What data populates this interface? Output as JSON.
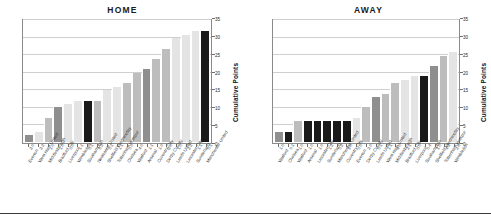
{
  "figure": {
    "y_axis_label": "Cumulative Points",
    "y_ticks": [
      "0",
      "5",
      "10",
      "15",
      "20",
      "25",
      "30",
      "35"
    ],
    "colors": {
      "bar_dark": "#8f8f8f",
      "bar_light": "#e4e4e4",
      "bar_mid": "#bdbdbd",
      "bar_black": "#1a1a1a",
      "grid": "#cfcfcf",
      "axis": "#8a8a8a"
    }
  },
  "chart_data": [
    {
      "type": "bar",
      "title": "HOME",
      "xlabel": "",
      "ylabel": "Cumulative Points",
      "ylim": [
        0,
        35
      ],
      "ytick_step": 5,
      "grid": true,
      "legend": "none",
      "categories": [
        "Everton",
        "West Ham United",
        "Middlesbrough",
        "Bradford City",
        "Liverpool",
        "Wimbledon",
        "Southampton",
        "Newcastle United",
        "Sheffield Wednesday",
        "Tottenham Hotspur",
        "Chelsea",
        "Watford",
        "Arsenal",
        "Coventry City",
        "Derby County",
        "Leeds United",
        "Leicester City",
        "Sunderland",
        "Manchester United"
      ],
      "scores": [
        "2-0",
        "2-2",
        "1-0",
        "1-0",
        "0-0",
        "1-1",
        "0-1",
        "0-3",
        "0-1",
        "1-1",
        "0-0",
        "4-0",
        "1-1",
        "1-0",
        "2-0",
        "1-0",
        "2-2",
        "1-1",
        "0-1"
      ],
      "values": [
        2,
        3,
        7,
        10,
        11,
        12,
        12,
        12,
        15,
        16,
        17,
        20,
        21,
        24,
        27,
        30,
        31,
        32,
        32
      ],
      "bar_colors": [
        "bar_dark",
        "bar_light",
        "bar_mid",
        "bar_dark",
        "bar_light",
        "bar_light",
        "bar_black",
        "bar_mid",
        "bar_light",
        "bar_light",
        "bar_mid",
        "bar_mid",
        "bar_dark",
        "bar_mid",
        "bar_mid",
        "bar_light",
        "bar_light",
        "bar_light",
        "bar_black"
      ]
    },
    {
      "type": "bar",
      "title": "AWAY",
      "xlabel": "",
      "ylabel": "Cumulative Points",
      "ylim": [
        0,
        35
      ],
      "ytick_step": 5,
      "grid": true,
      "legend": "none",
      "categories": [
        "Watford",
        "Chelsea",
        "Watford",
        "Arsenal",
        "Leicester City",
        "Sunderland",
        "Manchester United",
        "Coventry City",
        "Everton",
        "Derby County",
        "Leeds United",
        "West Ham United",
        "Middlesbrough",
        "Bradford City",
        "Liverpool",
        "Southampton",
        "Sheffield Wednesday",
        "Tottenham Hotspur",
        "Wimbledon"
      ],
      "scores": [
        "1-0",
        "0-1",
        "1-0",
        "1-0",
        "1-0",
        "1-2",
        "0-2",
        "1-0",
        "0-0",
        "2-0",
        "0-1",
        "1-1",
        "4-0",
        "2-1",
        "0-0",
        "0-4",
        "1-0",
        "4-3",
        "2-8"
      ],
      "values": [
        3,
        3,
        6,
        6,
        6,
        6,
        6,
        6,
        7,
        10,
        13,
        14,
        17,
        18,
        19,
        19,
        22,
        25,
        26
      ],
      "bar_colors": [
        "bar_dark",
        "bar_black",
        "bar_mid",
        "bar_black",
        "bar_black",
        "bar_black",
        "bar_black",
        "bar_black",
        "bar_light",
        "bar_mid",
        "bar_dark",
        "bar_mid",
        "bar_mid",
        "bar_light",
        "bar_light",
        "bar_black",
        "bar_dark",
        "bar_mid",
        "bar_light"
      ]
    }
  ]
}
